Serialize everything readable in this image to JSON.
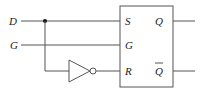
{
  "diagram": {
    "inputs": [
      {
        "id": "D",
        "label": "D"
      },
      {
        "id": "G",
        "label": "G"
      }
    ],
    "latch": {
      "input_labels": {
        "S": "S",
        "G": "G",
        "R": "R"
      },
      "output_labels": {
        "Q": "Q",
        "Qbar": "Q"
      }
    },
    "components": [
      "junction-dot",
      "inverter",
      "sr-latch-box"
    ],
    "colors": {
      "wire": "#555555",
      "text": "#222222",
      "background": "#ffffff"
    }
  }
}
